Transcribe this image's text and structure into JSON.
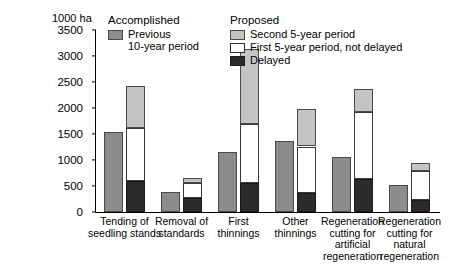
{
  "chart_data": {
    "type": "bar",
    "title": "",
    "subtitle": "",
    "xlabel": "",
    "ylabel": "1000 ha",
    "ylim": [
      0,
      3500
    ],
    "yticks": [
      0,
      500,
      1000,
      1500,
      2000,
      2500,
      3000,
      3500
    ],
    "grid": false,
    "legend_position": "top",
    "categories": [
      "Tending of\nseedling stands",
      "Removal of\nstandards",
      "First\nthinnings",
      "Other\nthinnings",
      "Regeneration\ncutting for\nartificial\nregeneration",
      "Regeneration\ncutting for\nnatural\nregeneration"
    ],
    "series": [
      {
        "name": "Previous 10-year period",
        "group": "Accomplished",
        "stacked": false,
        "color": "#8c8c8c",
        "values": [
          1540,
          380,
          1150,
          1360,
          1060,
          510
        ]
      },
      {
        "name": "Delayed",
        "group": "Proposed",
        "stacked": true,
        "color": "#2b2b2b",
        "values": [
          600,
          260,
          560,
          370,
          640,
          230
        ]
      },
      {
        "name": "First 5-year period, not delayed",
        "group": "Proposed",
        "stacked": true,
        "color": "#ffffff",
        "values": [
          1020,
          290,
          1130,
          890,
          1290,
          550
        ]
      },
      {
        "name": "Second 5-year period",
        "group": "Proposed",
        "stacked": true,
        "color": "#c4c4c4",
        "values": [
          800,
          110,
          1450,
          730,
          440,
          160
        ]
      }
    ],
    "stack_cumulative_tops": [
      [
        600,
        1620,
        2420
      ],
      [
        260,
        550,
        660
      ],
      [
        560,
        1690,
        3140
      ],
      [
        370,
        1260,
        1990
      ],
      [
        640,
        1930,
        2370
      ],
      [
        230,
        780,
        940
      ]
    ]
  },
  "axis": {
    "unit_label": "1000 ha",
    "tick_labels": [
      "3500",
      "3000",
      "2500",
      "2000",
      "1500",
      "1000",
      "500",
      "0"
    ]
  },
  "legends": {
    "accomplished": {
      "title": "Accomplished",
      "items": [
        {
          "label": "Previous\n10-year period",
          "swatch": "previous-10-year-swatch"
        }
      ]
    },
    "proposed": {
      "title": "Proposed",
      "items": [
        {
          "label": "Second 5-year period",
          "swatch": "second-5-year-swatch"
        },
        {
          "label": "First 5-year period, not delayed",
          "swatch": "first-5-year-swatch"
        },
        {
          "label": "Delayed",
          "swatch": "delayed-swatch"
        }
      ]
    }
  }
}
